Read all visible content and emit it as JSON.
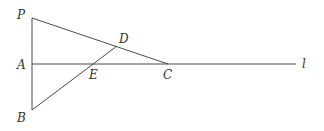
{
  "diagram": {
    "stroke_color": "#4a4a4a",
    "label_color": "#333333",
    "background": "#ffffff",
    "points": {
      "P": {
        "label": "P",
        "x": 32,
        "y": 18
      },
      "A": {
        "label": "A",
        "x": 32,
        "y": 64
      },
      "B": {
        "label": "B",
        "x": 32,
        "y": 110
      },
      "C": {
        "label": "C",
        "x": 168,
        "y": 64
      },
      "D": {
        "label": "D",
        "x": 117,
        "y": 46
      },
      "E": {
        "label": "E",
        "x": 94,
        "y": 64
      }
    },
    "line_label": "l",
    "segments": [
      {
        "from": "P",
        "to": "B",
        "name": "segment-PB"
      },
      {
        "from": "P",
        "to": "C",
        "name": "segment-PC"
      },
      {
        "from": "B",
        "to": "D",
        "name": "segment-BD"
      },
      {
        "from": "A",
        "to": "l_end",
        "name": "line-l"
      }
    ]
  }
}
